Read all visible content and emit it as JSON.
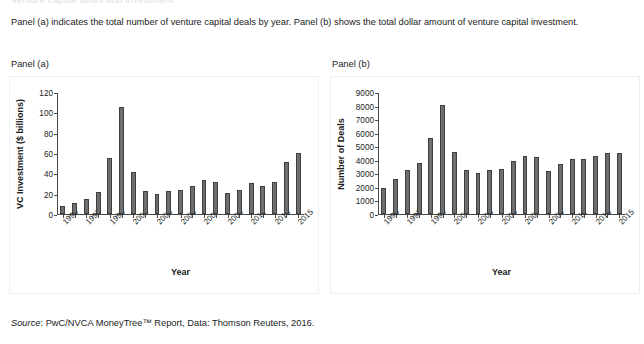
{
  "figure": {
    "top_clipped_text": "venture capital deals and investment",
    "caption": "Panel (a) indicates the total number of venture capital deals by year. Panel (b) shows the total dollar amount of venture capital investment.",
    "source_prefix": "Source",
    "source_text": ": PwC/NVCA MoneyTree™ Report, Data: Thomson Reuters, 2016.",
    "bar_color": "#6e6e6e",
    "bar_edge_color": "#3f3f3f",
    "axis_color": "#4a4a4a",
    "background": "#ffffff"
  },
  "panels": [
    {
      "id": "a",
      "label": "Panel (a)"
    },
    {
      "id": "b",
      "label": "Panel (b)"
    }
  ],
  "chart_data": [
    {
      "type": "bar",
      "panel": "Panel (a)",
      "title": "",
      "xlabel": "Year",
      "ylabel": "VC Investment ($ billions)",
      "ylim": [
        0,
        120
      ],
      "yticks": [
        0,
        20,
        40,
        60,
        80,
        100,
        120
      ],
      "grid": false,
      "legend": null,
      "categories": [
        "1995",
        "1996",
        "1997",
        "1998",
        "1999",
        "2000",
        "2001",
        "2002",
        "2003",
        "2004",
        "2005",
        "2006",
        "2007",
        "2008",
        "2009",
        "2010",
        "2011",
        "2012",
        "2013",
        "2014",
        "2015"
      ],
      "tick_labels_shown": [
        "1995",
        "1997",
        "1999",
        "2001",
        "2003",
        "2005",
        "2007",
        "2009",
        "2011",
        "2013",
        "2015"
      ],
      "values": [
        8,
        11,
        15,
        22,
        55,
        105,
        41,
        22.5,
        20,
        23,
        23.5,
        28,
        33,
        31,
        21,
        24,
        30.5,
        28,
        31,
        51,
        60
      ]
    },
    {
      "type": "bar",
      "panel": "Panel (b)",
      "title": "",
      "xlabel": "Year",
      "ylabel": "Number of Deals",
      "ylim": [
        0,
        9000
      ],
      "yticks": [
        0,
        1000,
        2000,
        3000,
        4000,
        5000,
        6000,
        7000,
        8000,
        9000
      ],
      "grid": false,
      "legend": null,
      "categories": [
        "1995",
        "1996",
        "1997",
        "1998",
        "1999",
        "2000",
        "2001",
        "2002",
        "2003",
        "2004",
        "2005",
        "2006",
        "2007",
        "2008",
        "2009",
        "2010",
        "2011",
        "2012",
        "2013",
        "2014",
        "2015"
      ],
      "tick_labels_shown": [
        "1995",
        "1997",
        "1999",
        "2001",
        "2003",
        "2005",
        "2007",
        "2009",
        "2011",
        "2013",
        "2015"
      ],
      "values": [
        1900,
        2600,
        3250,
        3750,
        5600,
        8050,
        4600,
        3250,
        3050,
        3250,
        3320,
        3930,
        4250,
        4220,
        3200,
        3700,
        4080,
        4030,
        4300,
        4480,
        4500
      ]
    }
  ]
}
